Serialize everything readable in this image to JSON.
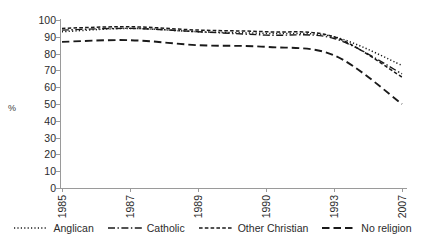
{
  "chart_data": {
    "type": "line",
    "title": "",
    "xlabel": "",
    "ylabel": "%",
    "categories": [
      "1985",
      "1987",
      "1989",
      "1990",
      "1993",
      "2007"
    ],
    "ylim": [
      0,
      100
    ],
    "yticks": [
      0,
      10,
      20,
      30,
      40,
      50,
      60,
      70,
      80,
      90,
      100
    ],
    "grid": false,
    "legend_position": "bottom",
    "series": [
      {
        "name": "Anglican",
        "style": "dotted",
        "color": "#1a1a1a",
        "values": [
          93,
          95,
          93,
          92,
          90,
          73
        ]
      },
      {
        "name": "Catholic",
        "style": "dash-dot",
        "color": "#1a1a1a",
        "values": [
          94,
          95,
          93,
          91,
          89,
          68
        ]
      },
      {
        "name": "Other Christian",
        "style": "short-dash",
        "color": "#1a1a1a",
        "values": [
          95,
          96,
          94,
          93,
          90,
          66
        ]
      },
      {
        "name": "No religion",
        "style": "long-dash",
        "color": "#1a1a1a",
        "values": [
          87,
          88,
          85,
          84,
          79,
          50
        ]
      }
    ]
  },
  "axis": {
    "unit_label": "%",
    "y_tick_labels": [
      "100",
      "90",
      "80",
      "70",
      "60",
      "50",
      "40",
      "30",
      "20",
      "10",
      "0"
    ],
    "x_tick_labels": [
      "1985",
      "1987",
      "1989",
      "1990",
      "1993",
      "2007"
    ]
  },
  "legend": {
    "items": [
      {
        "label": "Anglican",
        "style": "dotted"
      },
      {
        "label": "Catholic",
        "style": "dash-dot"
      },
      {
        "label": "Other Christian",
        "style": "short-dash"
      },
      {
        "label": "No religion",
        "style": "long-dash"
      }
    ]
  }
}
